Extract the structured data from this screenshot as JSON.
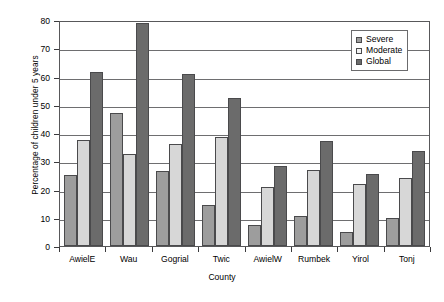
{
  "chart_data": {
    "type": "bar",
    "title": "",
    "xlabel": "County",
    "ylabel": "Percentage of children under 5 years",
    "ylim": [
      0,
      80
    ],
    "yticks": [
      0,
      10,
      20,
      30,
      40,
      50,
      60,
      70,
      80
    ],
    "grid": true,
    "legend_position": "top-right",
    "categories": [
      "AwielE",
      "Wau",
      "Gogrial",
      "Twic",
      "AwielW",
      "Rumbek",
      "Yirol",
      "Tonj"
    ],
    "series": [
      {
        "name": "Severe",
        "color": "#9d9d9d",
        "values": [
          25,
          47,
          26.5,
          14.5,
          7.5,
          10.5,
          5,
          10
        ]
      },
      {
        "name": "Moderate",
        "color": "#d7d7d7",
        "values": [
          37.5,
          32.5,
          36,
          38.5,
          21,
          27,
          22,
          24
        ]
      },
      {
        "name": "Global",
        "color": "#6b6b6b",
        "values": [
          61.5,
          79,
          61,
          52.5,
          28.5,
          37,
          25.5,
          33.5
        ]
      }
    ]
  }
}
